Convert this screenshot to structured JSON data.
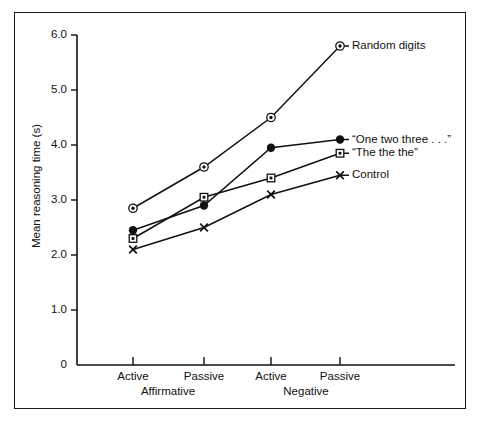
{
  "chart_data": {
    "type": "line",
    "title": "",
    "xlabel": "",
    "ylabel": "Mean reasoning time (s)",
    "ylim": [
      0,
      6.0
    ],
    "yticks": [
      "0",
      "1.0",
      "2.0",
      "3.0",
      "4.0",
      "5.0",
      "6.0"
    ],
    "ytick_values": [
      0,
      1.0,
      2.0,
      3.0,
      4.0,
      5.0,
      6.0
    ],
    "categories": [
      "Active",
      "Passive",
      "Active",
      "Passive"
    ],
    "group_labels": [
      "Affirmative",
      "Negative"
    ],
    "grid": false,
    "legend_position": "right-inline-labels",
    "series": [
      {
        "name": "Random digits",
        "marker": "circle-dot",
        "values": [
          2.85,
          3.6,
          4.5,
          5.8
        ]
      },
      {
        "name": "“One two three . . .”",
        "marker": "filled-circle",
        "values": [
          2.45,
          2.9,
          3.95,
          4.1
        ]
      },
      {
        "name": "“The the the”",
        "marker": "square-dot",
        "values": [
          2.3,
          3.05,
          3.4,
          3.85
        ]
      },
      {
        "name": "Control",
        "marker": "cross",
        "values": [
          2.1,
          2.5,
          3.1,
          3.45
        ]
      }
    ],
    "colors": {
      "line": "#111111",
      "marker": "#111111",
      "axis": "#111111",
      "background": "#ffffff",
      "frame": "#1a1a1a"
    }
  },
  "axis": {
    "y_label": "Mean reasoning time (s)",
    "y_ticks": [
      "6.0",
      "5.0",
      "4.0",
      "3.0",
      "2.0",
      "1.0"
    ],
    "zero_label": "0",
    "x_ticks": [
      "Active",
      "Passive",
      "Active",
      "Passive"
    ],
    "x_groups": [
      "Affirmative",
      "Negative"
    ]
  },
  "legend": {
    "items": [
      "Random digits",
      "“One two three . . .”",
      "“The the the”",
      "Control"
    ]
  }
}
